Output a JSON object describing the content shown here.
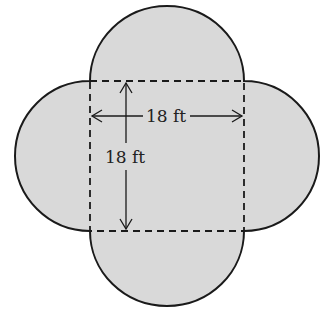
{
  "diagram": {
    "width_label": "18 ft",
    "height_label": "18 ft",
    "fill_color": "#d9d9d9",
    "stroke_color": "#1a1a1a"
  }
}
